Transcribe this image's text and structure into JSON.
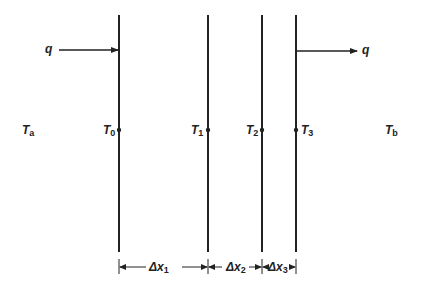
{
  "diagram": {
    "type": "composite wall heat conduction schematic",
    "planes": [
      {
        "id": "T0",
        "x": 119,
        "label": "T",
        "sub": "0"
      },
      {
        "id": "T1",
        "x": 208,
        "label": "T",
        "sub": "1"
      },
      {
        "id": "T2",
        "x": 262,
        "label": "T",
        "sub": "2"
      },
      {
        "id": "T3",
        "x": 296,
        "label": "T",
        "sub": "3"
      }
    ],
    "ambient": {
      "left": {
        "label": "T",
        "sub": "a"
      },
      "right": {
        "label": "T",
        "sub": "b"
      }
    },
    "heat_flow": {
      "in_label": "q",
      "out_label": "q"
    },
    "dimensions": [
      {
        "label": "Δx",
        "sub": "1"
      },
      {
        "label": "Δx",
        "sub": "2"
      },
      {
        "label": "Δx",
        "sub": "3"
      }
    ],
    "colors": {
      "line": "#222222",
      "background": "#ffffff"
    }
  }
}
